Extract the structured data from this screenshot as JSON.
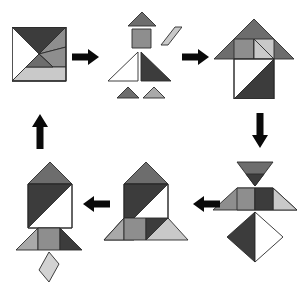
{
  "diagram": {
    "type": "tangram-step-diagram",
    "background_color": "#ffffff",
    "step_count": 6,
    "arrow_count": 5,
    "palette": {
      "dark": "#3c3c3c",
      "medium": "#6d6d6d",
      "gray": "#8e8e8e",
      "light": "#c9c9c9",
      "white": "#ffffff",
      "outline": "#2a2a2a",
      "arrow": "#0a0a0a"
    },
    "piece_names": [
      "large-triangle-dark",
      "large-triangle-white",
      "medium-triangle-gray",
      "small-triangle-dark",
      "small-triangle-light",
      "square-gray",
      "parallelogram-light"
    ],
    "steps": [
      {
        "id": "step-1",
        "label": "assembled-square",
        "caption": "Tangram square",
        "position": {
          "x": 12,
          "y": 27,
          "w": 54,
          "h": 57
        }
      },
      {
        "id": "step-2",
        "label": "exploded-pieces",
        "caption": "Seven separated pieces",
        "position": {
          "x": 98,
          "y": 8,
          "w": 82,
          "h": 100
        }
      },
      {
        "id": "step-3",
        "label": "arrow-house-figure",
        "caption": "Arrow / house figure",
        "position": {
          "x": 212,
          "y": 17,
          "w": 82,
          "h": 80
        }
      },
      {
        "id": "step-4",
        "label": "bowtie-diamond-figure",
        "caption": "Bowtie and diamond figure",
        "position": {
          "x": 210,
          "y": 160,
          "w": 88,
          "h": 105
        }
      },
      {
        "id": "step-5",
        "label": "rocket-flared-base",
        "caption": "Rocket with flared base",
        "position": {
          "x": 100,
          "y": 160,
          "w": 90,
          "h": 85
        }
      },
      {
        "id": "step-6",
        "label": "rocket-with-flame",
        "caption": "Rocket with flame",
        "position": {
          "x": 12,
          "y": 160,
          "w": 80,
          "h": 122
        }
      }
    ],
    "arrows": [
      {
        "id": "arrow-1",
        "name": "arrow-right-square-to-pieces",
        "direction": "right",
        "from": "step-1",
        "to": "step-2",
        "x": 72,
        "y": 49,
        "length": 26
      },
      {
        "id": "arrow-2",
        "name": "arrow-right-pieces-to-house",
        "direction": "right",
        "from": "step-2",
        "to": "step-3",
        "x": 182,
        "y": 49,
        "length": 26
      },
      {
        "id": "arrow-3",
        "name": "arrow-down-house-to-bowtie",
        "direction": "down",
        "from": "step-3",
        "to": "step-4",
        "x": 252,
        "y": 113,
        "length": 34
      },
      {
        "id": "arrow-4",
        "name": "arrow-left-bowtie-to-rocket",
        "direction": "left",
        "from": "step-4",
        "to": "step-5",
        "x": 192,
        "y": 196,
        "length": 26
      },
      {
        "id": "arrow-5",
        "name": "arrow-left-rocket-to-flame-rocket",
        "direction": "left",
        "from": "step-5",
        "to": "step-6",
        "x": 82,
        "y": 196,
        "length": 26
      },
      {
        "id": "arrow-6",
        "name": "arrow-up-flame-rocket-to-square",
        "direction": "up",
        "from": "step-6",
        "to": "step-1",
        "x": 32,
        "y": 113,
        "length": 34
      }
    ]
  }
}
